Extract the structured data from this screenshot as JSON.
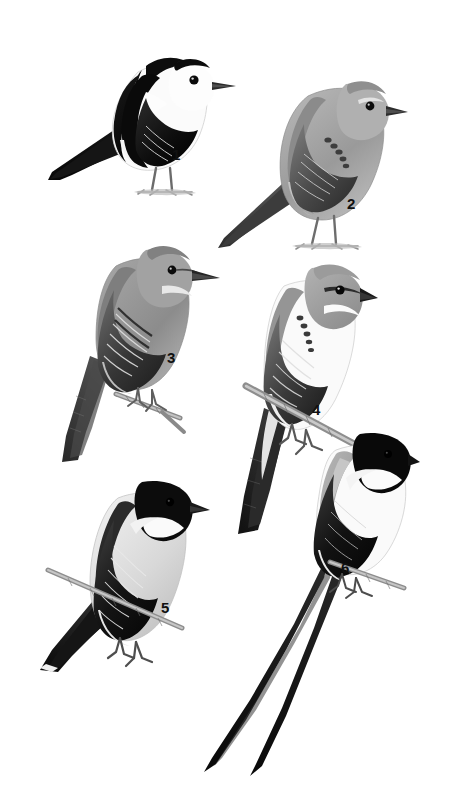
{
  "plate": {
    "title": "Bird identification plate",
    "description": "Grayscale field-guide illustration plate of six perched tyrant flycatchers on a plain white background",
    "background_color": "#ffffff",
    "width": 455,
    "height": 803,
    "figure_count": 6
  },
  "palette": {
    "black": "#111111",
    "near_black": "#1d1d1d",
    "dark_gray": "#3b3b3b",
    "mid_gray": "#6f6f6f",
    "light_gray": "#a8a8a8",
    "pale_gray": "#cfcfcf",
    "off_white": "#f2f2f2",
    "white": "#ffffff",
    "branch_gray": "#9a9a9a",
    "label_color": "#101010"
  },
  "figures": [
    {
      "number": "1",
      "name": "pied-water-tyrant",
      "plumage": "black and white; white face and underparts, black crown stripe, black back and wings with white wing patch, black tail",
      "posture": "perched on ground, facing right",
      "label_x": 172,
      "label_y": 147,
      "bird_x": 42,
      "bird_y": 22,
      "bird_w": 200,
      "bird_h": 180,
      "has_perch": false,
      "tail_length": "short"
    },
    {
      "number": "2",
      "name": "gray-tyrant-pale",
      "plumage": "plain gray above, pale gray below, darker gray wings with dark coverts, dark bill",
      "posture": "perched on ground, facing right",
      "label_x": 347,
      "label_y": 196,
      "bird_x": 212,
      "bird_y": 62,
      "bird_w": 192,
      "bird_h": 190,
      "has_perch": false,
      "tail_length": "medium"
    },
    {
      "number": "3",
      "name": "gray-flycatcher-long-tail",
      "plumage": "gray head and back, pale throat, dark streaked wings, long dark tail",
      "posture": "perched on small twig, facing right, long tail angled down",
      "label_x": 167,
      "label_y": 350,
      "bird_x": 52,
      "bird_y": 236,
      "bird_w": 176,
      "bird_h": 230,
      "has_perch": true,
      "tail_length": "long"
    },
    {
      "number": "4",
      "name": "gray-kingbird",
      "plumage": "gray crown with dark mask, white throat and underparts, gray-brown wings, dark tail",
      "posture": "perched on diagonal branch, facing right",
      "label_x": 312,
      "label_y": 402,
      "bird_x": 218,
      "bird_y": 258,
      "bird_w": 160,
      "bird_h": 290,
      "has_perch": true,
      "tail_length": "long"
    },
    {
      "number": "5",
      "name": "black-capped-kingbird",
      "plumage": "black cap and nape, white throat, pale gray breast, blackish wings with pale edges, black tail with white tip",
      "posture": "perched on thin branch, facing right",
      "label_x": 161,
      "label_y": 600,
      "bird_x": 32,
      "bird_y": 472,
      "bird_w": 178,
      "bird_h": 220,
      "has_perch": true,
      "tail_length": "long"
    },
    {
      "number": "6",
      "name": "fork-tailed-flycatcher",
      "plumage": "glossy black head, gray back, white underparts, black wings, extremely long forked black tail streamers",
      "posture": "perched on thin branch, facing right, very long forked tail trailing down-left",
      "label_x": 341,
      "label_y": 560,
      "bird_x": 190,
      "bird_y": 428,
      "bird_w": 230,
      "bird_h": 350,
      "has_perch": true,
      "tail_length": "very long forked"
    }
  ]
}
